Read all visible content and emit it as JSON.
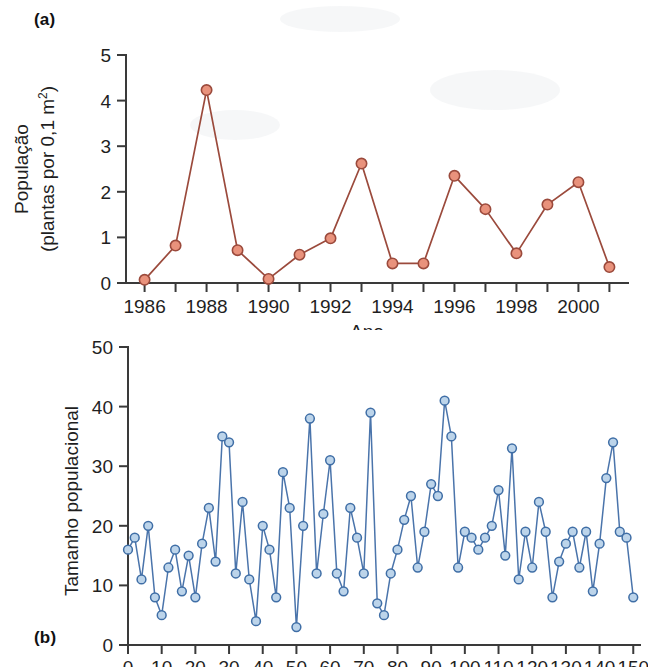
{
  "figure": {
    "panel_a_label": "(a)",
    "panel_b_label": "(b)"
  },
  "chart_data": [
    {
      "id": "panel-a",
      "type": "line",
      "title": "",
      "xlabel": "Ano",
      "ylabel_line1": "População",
      "ylabel_line2": "(plantas por 0,1 m",
      "ylabel_exponent": "2",
      "ylabel_close": ")",
      "ylabel_full": "População (plantas por 0,1 m²)",
      "xlim": [
        1985.4,
        2001.6
      ],
      "ylim": [
        0,
        5
      ],
      "yticks": [
        0,
        1,
        2,
        3,
        4,
        5
      ],
      "ytick_labels": [
        "0",
        "1",
        "2",
        "3",
        "4",
        "5"
      ],
      "xticks": [
        1986,
        1987,
        1988,
        1989,
        1990,
        1991,
        1992,
        1993,
        1994,
        1995,
        1996,
        1997,
        1998,
        1999,
        2000,
        2001
      ],
      "xtick_labels_shown": [
        "1986",
        "1988",
        "1990",
        "1992",
        "1994",
        "1996",
        "1998",
        "2000"
      ],
      "xtick_label_values": [
        1986,
        1988,
        1990,
        1992,
        1994,
        1996,
        1998,
        2000
      ],
      "grid": false,
      "legend": "none",
      "marker_fill": "#e9927c",
      "marker_stroke": "#9b4a3c",
      "line_color": "#9b4a3c",
      "x": [
        1986,
        1987,
        1988,
        1989,
        1990,
        1991,
        1992,
        1993,
        1994,
        1995,
        1996,
        1997,
        1998,
        1999,
        2000,
        2001
      ],
      "values": [
        0.07,
        0.82,
        4.23,
        0.72,
        0.09,
        0.62,
        0.98,
        2.62,
        0.43,
        0.43,
        2.35,
        1.62,
        0.65,
        1.72,
        2.21,
        0.35
      ]
    },
    {
      "id": "panel-b",
      "type": "line",
      "title": "",
      "xlabel": "",
      "ylabel_full": "Tamanho populacional",
      "xlim": [
        0,
        152
      ],
      "ylim": [
        0,
        50
      ],
      "yticks": [
        0,
        10,
        20,
        30,
        40,
        50
      ],
      "ytick_labels": [
        "0",
        "10",
        "20",
        "30",
        "40",
        "50"
      ],
      "xticks": [
        0,
        10,
        20,
        30,
        40,
        50,
        60,
        70,
        80,
        90,
        100,
        110,
        120,
        130,
        140,
        150
      ],
      "xtick_labels": [
        "0",
        "10",
        "20",
        "30",
        "40",
        "50",
        "60",
        "70",
        "80",
        "90",
        "100",
        "110",
        "120",
        "130",
        "140",
        "150"
      ],
      "grid": false,
      "legend": "none",
      "marker_fill": "#bcd4ea",
      "marker_stroke": "#3f6ea6",
      "line_color": "#4a74ab",
      "x": [
        0,
        2,
        4,
        6,
        8,
        10,
        12,
        14,
        16,
        18,
        20,
        22,
        24,
        26,
        28,
        30,
        32,
        34,
        36,
        38,
        40,
        42,
        44,
        46,
        48,
        50,
        52,
        54,
        56,
        58,
        60,
        62,
        64,
        66,
        68,
        70,
        72,
        74,
        76,
        78,
        80,
        82,
        84,
        86,
        88,
        90,
        92,
        94,
        96,
        98,
        100,
        102,
        104,
        106,
        108,
        110,
        112,
        114,
        116,
        118,
        120,
        122,
        124,
        126,
        128,
        130,
        132,
        134,
        136,
        138,
        140,
        142,
        144,
        146,
        148,
        150
      ],
      "values": [
        16,
        18,
        11,
        20,
        8,
        5,
        13,
        16,
        9,
        15,
        8,
        17,
        23,
        14,
        35,
        34,
        12,
        24,
        11,
        4,
        20,
        16,
        8,
        29,
        23,
        3,
        20,
        38,
        12,
        22,
        31,
        12,
        9,
        23,
        18,
        12,
        39,
        7,
        5,
        12,
        16,
        21,
        25,
        13,
        19,
        27,
        25,
        41,
        35,
        13,
        19,
        18,
        16,
        18,
        20,
        26,
        15,
        33,
        11,
        19,
        13,
        24,
        19,
        8,
        14,
        17,
        19,
        13,
        19,
        9,
        17,
        28,
        34,
        19,
        18,
        8
      ]
    }
  ]
}
